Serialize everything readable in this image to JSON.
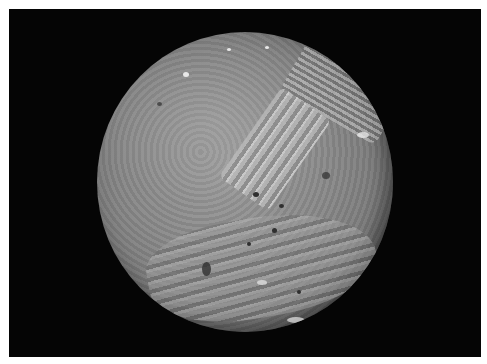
{
  "image": {
    "subject": "Cratered grey moon (Miranda) on black background",
    "background_color": "#050505",
    "border_color": "#ffffff",
    "surface_colors": [
      "#9a9a9a",
      "#878787",
      "#6f6f6f",
      "#5a5a5a"
    ]
  }
}
